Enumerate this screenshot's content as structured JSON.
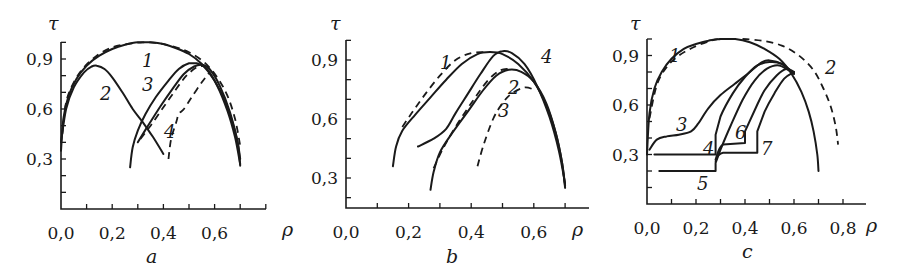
{
  "chart_data": [
    {
      "type": "line",
      "panel_label": "a",
      "xlabel": "ρ",
      "ylabel": "τ",
      "xlim": [
        0.0,
        0.73
      ],
      "ylim": [
        0.0,
        1.0
      ],
      "x_ticks": [
        "0,0",
        "0,2",
        "0,4",
        "0,6"
      ],
      "y_ticks": [
        "0,3",
        "0,6",
        "0,9"
      ],
      "series": [
        {
          "name": "1",
          "style": "solid",
          "x": [
            0.0,
            0.01,
            0.03,
            0.06,
            0.1,
            0.15,
            0.2,
            0.25,
            0.3,
            0.35,
            0.4,
            0.45,
            0.5,
            0.55,
            0.6,
            0.64,
            0.67,
            0.69,
            0.7
          ],
          "y": [
            0.35,
            0.55,
            0.68,
            0.78,
            0.86,
            0.92,
            0.96,
            0.985,
            1.0,
            1.0,
            0.99,
            0.965,
            0.93,
            0.87,
            0.77,
            0.65,
            0.52,
            0.4,
            0.3
          ]
        },
        {
          "name": "1-dashed",
          "style": "dashed",
          "x": [
            0.005,
            0.02,
            0.05,
            0.09,
            0.14,
            0.2,
            0.26,
            0.32,
            0.38,
            0.44,
            0.5,
            0.56,
            0.61,
            0.65,
            0.68,
            0.7
          ],
          "y": [
            0.45,
            0.64,
            0.76,
            0.85,
            0.92,
            0.97,
            0.99,
            1.0,
            0.995,
            0.975,
            0.94,
            0.88,
            0.79,
            0.68,
            0.54,
            0.38
          ]
        },
        {
          "name": "2",
          "style": "solid",
          "x": [
            0.0,
            0.02,
            0.05,
            0.09,
            0.12,
            0.14,
            0.17,
            0.2,
            0.24,
            0.28,
            0.32,
            0.36,
            0.4
          ],
          "y": [
            0.4,
            0.6,
            0.73,
            0.82,
            0.855,
            0.86,
            0.84,
            0.79,
            0.7,
            0.6,
            0.52,
            0.43,
            0.33
          ]
        },
        {
          "name": "3",
          "style": "solid",
          "x": [
            0.27,
            0.28,
            0.3,
            0.33,
            0.37,
            0.42,
            0.46,
            0.5,
            0.53,
            0.57,
            0.61,
            0.65,
            0.68,
            0.7
          ],
          "y": [
            0.25,
            0.37,
            0.47,
            0.57,
            0.67,
            0.77,
            0.84,
            0.875,
            0.875,
            0.84,
            0.74,
            0.59,
            0.43,
            0.27
          ]
        },
        {
          "name": "3b",
          "style": "solid",
          "x": [
            0.3,
            0.34,
            0.39,
            0.44,
            0.48,
            0.52,
            0.55,
            0.58,
            0.62,
            0.66,
            0.69,
            0.7
          ],
          "y": [
            0.4,
            0.5,
            0.62,
            0.73,
            0.81,
            0.855,
            0.865,
            0.84,
            0.74,
            0.58,
            0.4,
            0.26
          ]
        },
        {
          "name": "4",
          "style": "dashed",
          "x": [
            0.31,
            0.35,
            0.4,
            0.45,
            0.49,
            0.53,
            0.56
          ],
          "y": [
            0.42,
            0.5,
            0.61,
            0.72,
            0.8,
            0.85,
            0.86
          ]
        },
        {
          "name": "4b",
          "style": "dashed",
          "x": [
            0.42,
            0.43,
            0.45,
            0.46,
            0.48,
            0.51,
            0.55,
            0.58
          ],
          "y": [
            0.3,
            0.42,
            0.52,
            0.57,
            0.6,
            0.67,
            0.76,
            0.82
          ]
        }
      ],
      "annotations": [
        "1",
        "2",
        "3",
        "4"
      ]
    },
    {
      "type": "line",
      "panel_label": "b",
      "xlabel": "ρ",
      "ylabel": "τ",
      "xlim": [
        0.0,
        0.76
      ],
      "ylim": [
        0.15,
        1.0
      ],
      "x_ticks": [
        "0,0",
        "0,2",
        "0,4",
        "0,6"
      ],
      "y_ticks": [
        "0,3",
        "0,6",
        "0,9"
      ],
      "series": [
        {
          "name": "1",
          "style": "solid",
          "x": [
            0.15,
            0.16,
            0.18,
            0.22,
            0.27,
            0.32,
            0.37,
            0.42,
            0.46,
            0.5,
            0.55,
            0.6,
            0.64,
            0.67,
            0.69,
            0.7
          ],
          "y": [
            0.36,
            0.46,
            0.54,
            0.62,
            0.71,
            0.8,
            0.88,
            0.93,
            0.94,
            0.93,
            0.88,
            0.79,
            0.67,
            0.53,
            0.38,
            0.25
          ]
        },
        {
          "name": "1-dashed",
          "style": "dashed",
          "x": [
            0.18,
            0.21,
            0.25,
            0.3,
            0.35,
            0.4,
            0.44
          ],
          "y": [
            0.56,
            0.63,
            0.72,
            0.82,
            0.9,
            0.935,
            0.94
          ]
        },
        {
          "name": "4",
          "style": "solid",
          "x": [
            0.23,
            0.28,
            0.32,
            0.35,
            0.39,
            0.43,
            0.47,
            0.5,
            0.53,
            0.57,
            0.61,
            0.65,
            0.68,
            0.7
          ],
          "y": [
            0.46,
            0.5,
            0.55,
            0.63,
            0.73,
            0.83,
            0.92,
            0.945,
            0.935,
            0.88,
            0.77,
            0.61,
            0.44,
            0.27
          ]
        },
        {
          "name": "2",
          "style": "solid",
          "x": [
            0.27,
            0.28,
            0.3,
            0.34,
            0.39,
            0.44,
            0.48,
            0.52,
            0.56,
            0.6,
            0.64,
            0.67,
            0.69,
            0.7
          ],
          "y": [
            0.24,
            0.33,
            0.43,
            0.53,
            0.64,
            0.75,
            0.82,
            0.85,
            0.84,
            0.79,
            0.68,
            0.53,
            0.38,
            0.26
          ]
        },
        {
          "name": "2-dashed",
          "style": "dashed",
          "x": [
            0.28,
            0.31,
            0.35,
            0.4,
            0.45,
            0.49,
            0.52
          ],
          "y": [
            0.35,
            0.45,
            0.56,
            0.68,
            0.79,
            0.845,
            0.855
          ]
        },
        {
          "name": "3",
          "style": "dashed",
          "x": [
            0.42,
            0.44,
            0.47,
            0.5,
            0.53,
            0.57,
            0.6
          ],
          "y": [
            0.36,
            0.47,
            0.6,
            0.68,
            0.73,
            0.76,
            0.75
          ]
        }
      ],
      "annotations": [
        "1",
        "2",
        "3",
        "4"
      ]
    },
    {
      "type": "line",
      "panel_label": "c",
      "xlabel": "ρ",
      "ylabel": "τ",
      "xlim": [
        0.0,
        0.88
      ],
      "ylim": [
        0.0,
        1.0
      ],
      "x_ticks": [
        "0,0",
        "0,2",
        "0,4",
        "0,6",
        "0,8"
      ],
      "y_ticks": [
        "0,3",
        "0,6",
        "0,9"
      ],
      "series": [
        {
          "name": "1",
          "style": "solid",
          "x": [
            0.0,
            0.01,
            0.03,
            0.06,
            0.1,
            0.15,
            0.2,
            0.25,
            0.3
          ],
          "y": [
            0.3,
            0.55,
            0.7,
            0.8,
            0.88,
            0.94,
            0.97,
            0.99,
            1.0
          ]
        },
        {
          "name": "1-dashed",
          "style": "dashed",
          "x": [
            0.01,
            0.04,
            0.08,
            0.13,
            0.19,
            0.25,
            0.29
          ],
          "y": [
            0.52,
            0.72,
            0.83,
            0.9,
            0.95,
            0.985,
            1.0
          ]
        },
        {
          "name": "1-right",
          "style": "solid",
          "x": [
            0.3,
            0.36,
            0.42,
            0.48,
            0.54,
            0.59,
            0.63,
            0.66,
            0.68,
            0.695,
            0.7
          ],
          "y": [
            1.0,
            1.0,
            0.98,
            0.94,
            0.88,
            0.79,
            0.68,
            0.56,
            0.44,
            0.3,
            0.2
          ]
        },
        {
          "name": "2",
          "style": "dashed",
          "x": [
            0.39,
            0.47,
            0.55,
            0.62,
            0.68,
            0.72,
            0.75,
            0.77,
            0.78
          ],
          "y": [
            1.0,
            0.99,
            0.96,
            0.9,
            0.81,
            0.7,
            0.59,
            0.47,
            0.36
          ]
        },
        {
          "name": "3",
          "style": "solid",
          "x": [
            0.01,
            0.04,
            0.08,
            0.13,
            0.18,
            0.21,
            0.25,
            0.3,
            0.36,
            0.42,
            0.47,
            0.5,
            0.55,
            0.6
          ],
          "y": [
            0.33,
            0.39,
            0.41,
            0.42,
            0.44,
            0.49,
            0.58,
            0.66,
            0.73,
            0.8,
            0.86,
            0.87,
            0.85,
            0.79
          ]
        },
        {
          "name": "4",
          "style": "solid",
          "x": [
            0.03,
            0.28,
            0.28,
            0.3,
            0.35,
            0.4,
            0.45,
            0.5,
            0.55,
            0.6
          ],
          "y": [
            0.3,
            0.3,
            0.42,
            0.53,
            0.67,
            0.77,
            0.84,
            0.86,
            0.85,
            0.79
          ]
        },
        {
          "name": "5",
          "style": "solid",
          "x": [
            0.05,
            0.28,
            0.28,
            0.3,
            0.34,
            0.39,
            0.44,
            0.49,
            0.54,
            0.6
          ],
          "y": [
            0.2,
            0.2,
            0.25,
            0.33,
            0.47,
            0.63,
            0.75,
            0.82,
            0.84,
            0.79
          ]
        },
        {
          "name": "6",
          "style": "solid",
          "x": [
            0.28,
            0.31,
            0.4,
            0.4,
            0.44,
            0.48,
            0.53,
            0.57,
            0.6
          ],
          "y": [
            0.27,
            0.36,
            0.37,
            0.44,
            0.57,
            0.69,
            0.78,
            0.82,
            0.8
          ]
        },
        {
          "name": "7",
          "style": "solid",
          "x": [
            0.28,
            0.31,
            0.45,
            0.45,
            0.48,
            0.52,
            0.56,
            0.6
          ],
          "y": [
            0.26,
            0.31,
            0.31,
            0.44,
            0.56,
            0.67,
            0.76,
            0.8
          ]
        }
      ],
      "annotations": [
        "1",
        "2",
        "3",
        "4",
        "5",
        "6",
        "7"
      ]
    }
  ]
}
